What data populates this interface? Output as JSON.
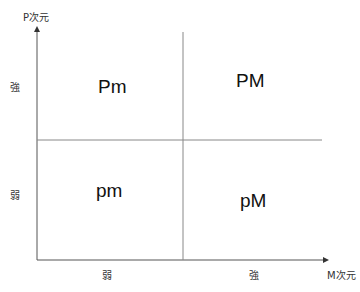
{
  "diagram": {
    "y_axis": {
      "label": "P次元",
      "ticks": [
        {
          "label": "強"
        },
        {
          "label": "弱"
        }
      ]
    },
    "x_axis": {
      "label": "M次元",
      "ticks": [
        {
          "label": "弱"
        },
        {
          "label": "強"
        }
      ]
    },
    "quadrants": {
      "top_left": "Pm",
      "top_right": "PM",
      "bottom_left": "pm",
      "bottom_right": "pM"
    },
    "colors": {
      "axis": "#555555",
      "divider": "#888888",
      "background": "#ffffff"
    }
  }
}
